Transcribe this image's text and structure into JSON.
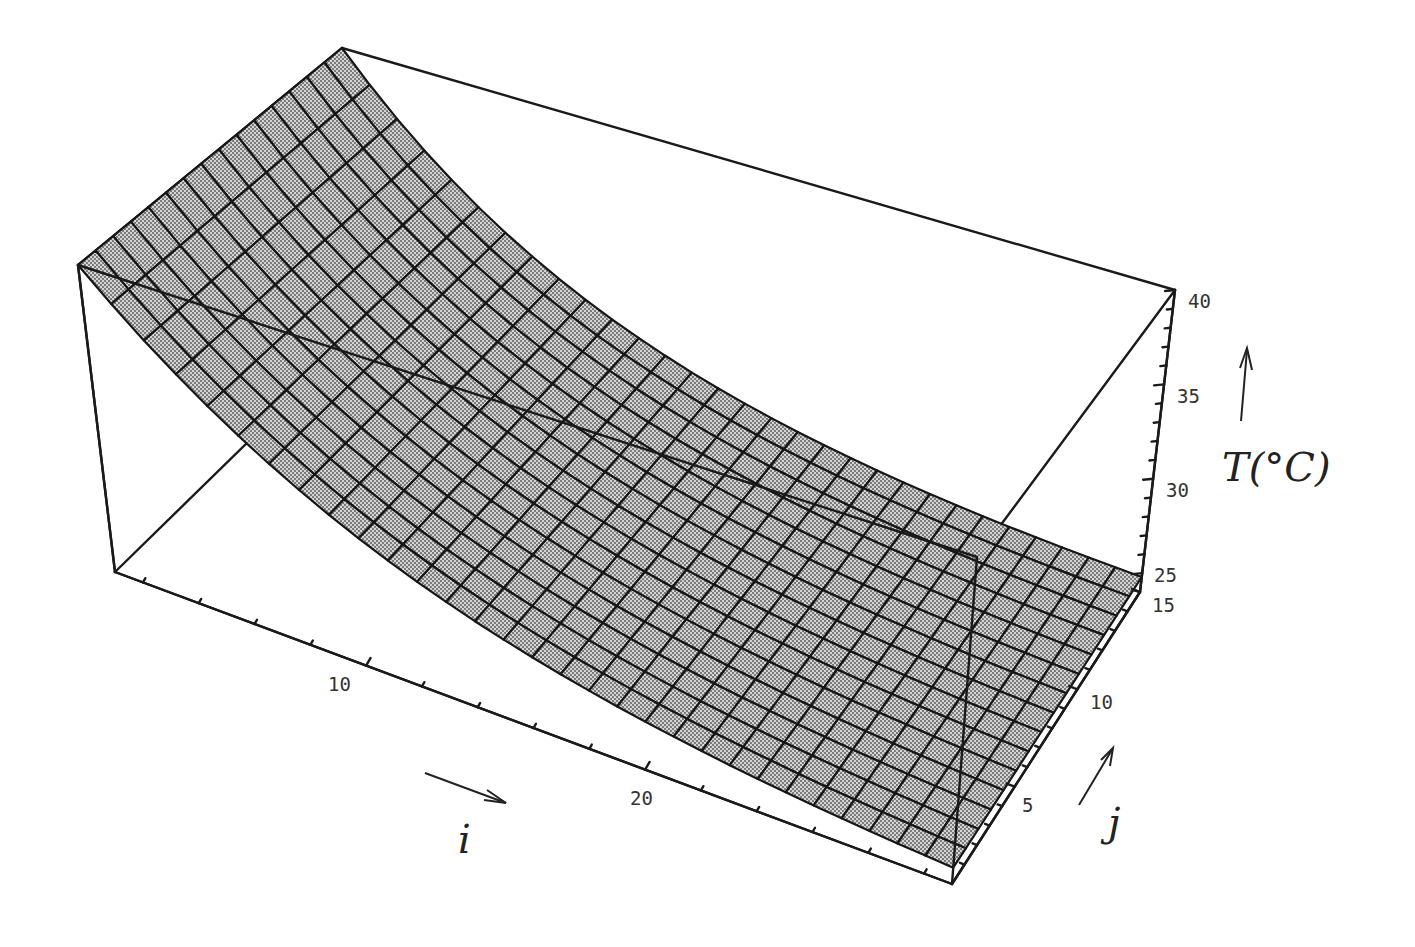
{
  "chart_data": {
    "type": "surface3d",
    "title": "",
    "axes": {
      "i": {
        "label": "i",
        "range": [
          1,
          31
        ],
        "ticks": [
          10,
          20
        ],
        "minor_tick_step": 2
      },
      "j": {
        "label": "j",
        "range": [
          0,
          15
        ],
        "ticks": [
          5,
          10,
          15
        ],
        "minor_tick_step": 1
      },
      "T": {
        "label": "T(°C)",
        "range": [
          24,
          40
        ],
        "ticks": [
          25,
          30,
          35,
          40
        ],
        "minor_tick_step": 1
      }
    },
    "surface": {
      "model": "T(i,j) = 24 + 16 * exp(-0.1 * (i - 1))",
      "i_cells": 30,
      "j_cells": 15,
      "T_at_i": [
        {
          "i": 1,
          "T": 40.0
        },
        {
          "i": 5,
          "T": 34.7
        },
        {
          "i": 10,
          "T": 30.5
        },
        {
          "i": 15,
          "T": 27.9
        },
        {
          "i": 20,
          "T": 26.4
        },
        {
          "i": 25,
          "T": 25.5
        },
        {
          "i": 31,
          "T": 24.8
        }
      ]
    },
    "tick_labels": {
      "i": [
        "10",
        "20"
      ],
      "j": [
        "5",
        "10",
        "15"
      ],
      "T": [
        "25",
        "30",
        "35",
        "40"
      ]
    },
    "axis_titles": {
      "i": "i",
      "j": "j",
      "T": "T(°C)"
    },
    "style": {
      "surface_fill": "#b9b9b9",
      "surface_dot": "#555555",
      "line_color": "#1a1a1a",
      "background": "#ffffff"
    },
    "projection_corners": {
      "i0_j0_Tmax": [
        78,
        265
      ],
      "i0_j15_Tmax": [
        342,
        48
      ],
      "iN_j15_Tmax": [
        1175,
        290
      ],
      "iN_j0_Tmax": [
        977,
        557
      ],
      "i0_j0_Tmin": [
        115,
        572
      ],
      "i0_j15_Tmin": [
        342,
        350
      ],
      "iN_j15_Tmin": [
        1140,
        592
      ],
      "iN_j0_Tmin": [
        952,
        884
      ]
    }
  }
}
